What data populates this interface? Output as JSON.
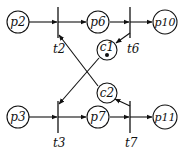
{
  "diagram": {
    "type": "petri-net",
    "places": [
      {
        "id": "p2",
        "label": "p2",
        "cx": 18,
        "cy": 22,
        "tokens": 0
      },
      {
        "id": "p6",
        "label": "p6",
        "cx": 98,
        "cy": 22,
        "tokens": 0
      },
      {
        "id": "p10",
        "label": "p10",
        "cx": 165,
        "cy": 22,
        "tokens": 0
      },
      {
        "id": "c1",
        "label": "c1",
        "cx": 107,
        "cy": 50,
        "tokens": 1
      },
      {
        "id": "c2",
        "label": "c2",
        "cx": 107,
        "cy": 93,
        "tokens": 0
      },
      {
        "id": "p3",
        "label": "p3",
        "cx": 18,
        "cy": 117,
        "tokens": 0
      },
      {
        "id": "p7",
        "label": "p7",
        "cx": 98,
        "cy": 117,
        "tokens": 0
      },
      {
        "id": "p11",
        "label": "p11",
        "cx": 165,
        "cy": 117,
        "tokens": 0
      }
    ],
    "transitions": [
      {
        "id": "t2",
        "label": "t2"
      },
      {
        "id": "t6",
        "label": "t6"
      },
      {
        "id": "t3",
        "label": "t3"
      },
      {
        "id": "t7",
        "label": "t7"
      }
    ],
    "arcs": [
      {
        "from": "p2",
        "to": "t2"
      },
      {
        "from": "t2",
        "to": "p6"
      },
      {
        "from": "p6",
        "to": "t6"
      },
      {
        "from": "t6",
        "to": "p10"
      },
      {
        "from": "t6",
        "to": "c1"
      },
      {
        "from": "c1",
        "to": "t3"
      },
      {
        "from": "c2",
        "to": "t2"
      },
      {
        "from": "t7",
        "to": "c2"
      },
      {
        "from": "p3",
        "to": "t3"
      },
      {
        "from": "t3",
        "to": "p7"
      },
      {
        "from": "p7",
        "to": "t7"
      },
      {
        "from": "t7",
        "to": "p11"
      }
    ]
  }
}
